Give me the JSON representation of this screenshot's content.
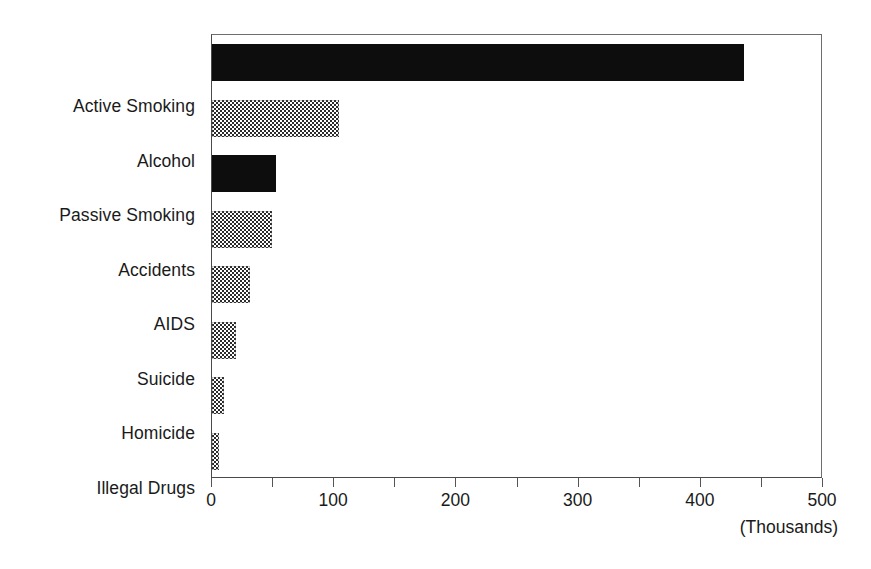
{
  "chart_data": {
    "type": "bar",
    "orientation": "horizontal",
    "title": "",
    "subtitle": "",
    "xlabel": "(Thousands)",
    "ylabel": "",
    "categories": [
      "Active Smoking",
      "Alcohol",
      "Passive Smoking",
      "Accidents",
      "AIDS",
      "Suicide",
      "Homicide",
      "Illegal Drugs"
    ],
    "values": [
      435,
      104,
      52,
      49,
      31,
      20,
      10,
      6
    ],
    "units": "thousands of deaths",
    "xlim": [
      0,
      500
    ],
    "xticks": [
      0,
      100,
      200,
      300,
      400,
      500
    ],
    "xtick_labels": [
      "0",
      "100",
      "200",
      "300",
      "400",
      "500"
    ],
    "minor_tick_interval": 50,
    "grid": false,
    "legend": null,
    "bar_fills": [
      "solid-black",
      "checker-dither",
      "solid-black",
      "checker-dither",
      "checker-dither",
      "checker-dither",
      "checker-dither",
      "checker-dither"
    ],
    "colors": {
      "solid": "#0d0d0d",
      "dither": "#2b2b2b",
      "axis": "#4a4a4a",
      "frame": "#6e6e6e",
      "text": "#1a1a1a",
      "background": "#ffffff"
    }
  }
}
